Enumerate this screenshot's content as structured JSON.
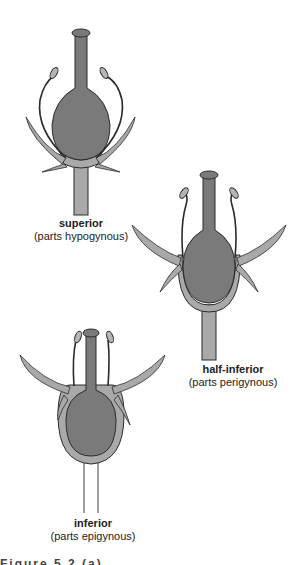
{
  "colors": {
    "ovary": "#7a7a7a",
    "receptacle": "#a9a9a9",
    "outline": "#2b2b2b",
    "background": "#ffffff"
  },
  "diagrams": [
    {
      "title": "superior",
      "subtitle": "(parts hypogynous)"
    },
    {
      "title": "half-inferior",
      "subtitle": "(parts perigynous)"
    },
    {
      "title": "inferior",
      "subtitle": "(parts epigynous)"
    }
  ],
  "caption": "Figure 5.2 (a)"
}
